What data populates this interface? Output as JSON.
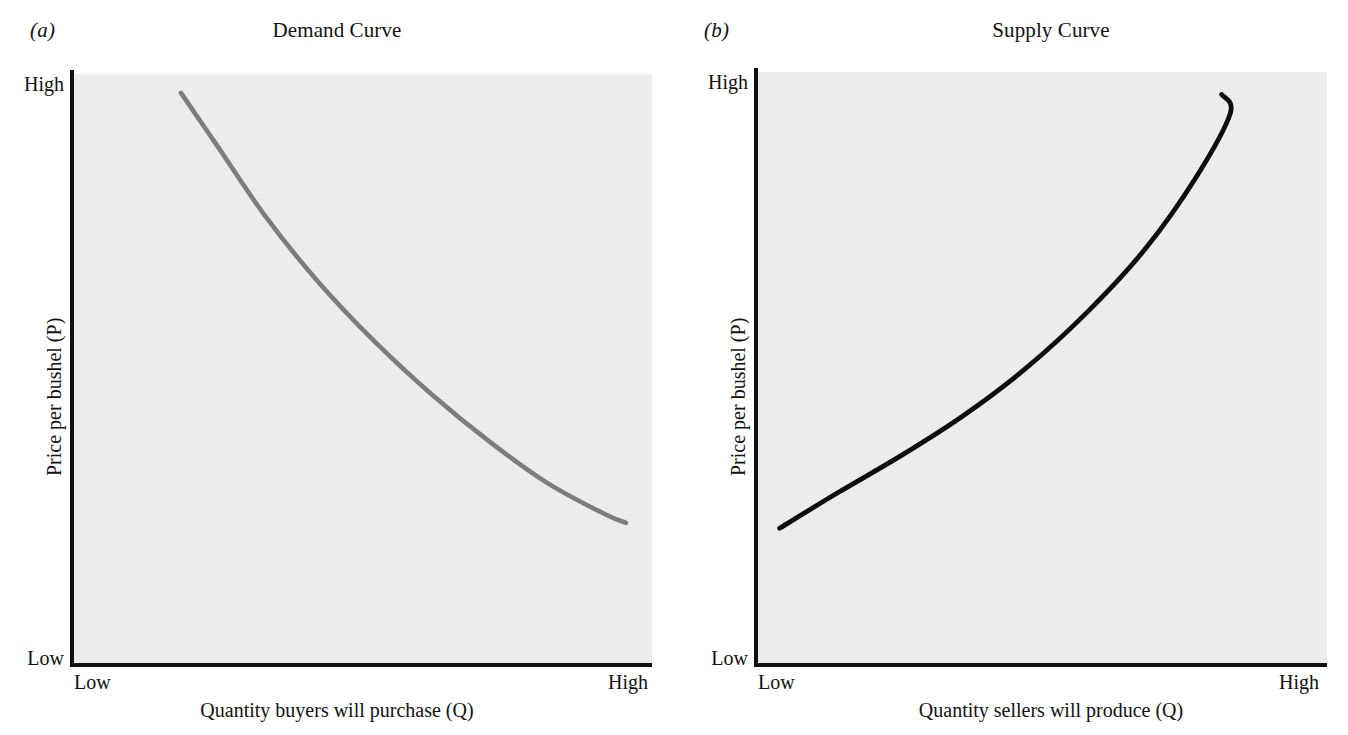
{
  "figure": {
    "panels": [
      {
        "marker": "(a)",
        "title": "Demand Curve",
        "y_axis": {
          "title": "Price per bushel (P)",
          "high": "High",
          "low": "Low"
        },
        "x_axis": {
          "title": "Quantity buyers will purchase (Q)",
          "low": "Low",
          "high": "High"
        },
        "curve_color": "#7d7d7d",
        "plot_background": "#e7e7e7"
      },
      {
        "marker": "(b)",
        "title": "Supply Curve",
        "y_axis": {
          "title": "Price per bushel (P)",
          "high": "High",
          "low": "Low"
        },
        "x_axis": {
          "title": "Quantity sellers will produce (Q)",
          "low": "Low",
          "high": "High"
        },
        "curve_color": "#0d0d0d",
        "plot_background": "#e7e7e7"
      }
    ]
  },
  "chart_data": [
    {
      "type": "line",
      "title": "Demand Curve",
      "panel_label": "(a)",
      "xlabel": "Quantity buyers will purchase (Q)",
      "ylabel": "Price per bushel (P)",
      "xticklabels": [
        "Low",
        "High"
      ],
      "yticklabels": [
        "Low",
        "High"
      ],
      "xlim": [
        0,
        1
      ],
      "ylim": [
        0,
        1
      ],
      "grid": false,
      "legend": "none",
      "series": [
        {
          "name": "Demand",
          "color": "#7d7d7d",
          "x": [
            0.185,
            0.25,
            0.33,
            0.42,
            0.52,
            0.62,
            0.72,
            0.82,
            0.92,
            0.955
          ],
          "y": [
            0.968,
            0.875,
            0.76,
            0.65,
            0.546,
            0.455,
            0.375,
            0.305,
            0.252,
            0.238
          ]
        }
      ],
      "annotation": "Downward-sloping convex demand curve; quantity demanded falls as price rises."
    },
    {
      "type": "line",
      "title": "Supply Curve",
      "panel_label": "(b)",
      "xlabel": "Quantity sellers will produce (Q)",
      "ylabel": "Price per bushel (P)",
      "xticklabels": [
        "Low",
        "High"
      ],
      "yticklabels": [
        "Low",
        "High"
      ],
      "xlim": [
        0,
        1
      ],
      "ylim": [
        0,
        1
      ],
      "grid": false,
      "legend": "none",
      "series": [
        {
          "name": "Supply",
          "color": "#0d0d0d",
          "x": [
            0.038,
            0.14,
            0.25,
            0.36,
            0.47,
            0.58,
            0.68,
            0.77,
            0.83,
            0.815
          ],
          "y": [
            0.228,
            0.288,
            0.35,
            0.418,
            0.498,
            0.595,
            0.7,
            0.822,
            0.93,
            0.962
          ]
        }
      ],
      "annotation": "Upward-sloping convex supply curve; quantity supplied rises as price rises."
    }
  ]
}
